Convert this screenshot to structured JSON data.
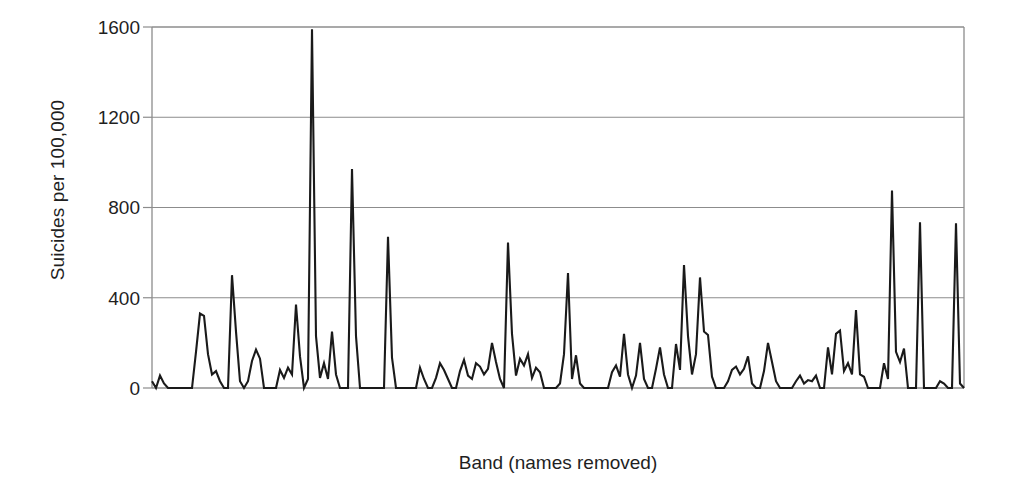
{
  "chart_data": {
    "type": "line",
    "title": "",
    "subtitle": "",
    "xlabel": "Band (names removed)",
    "ylabel": "Suicides per 100,000",
    "ylim": [
      0,
      1600
    ],
    "yticks": [
      0,
      400,
      800,
      1200,
      1600
    ],
    "ytick_labels": [
      "0",
      "400",
      "800",
      "1200",
      "1600"
    ],
    "xticks": [],
    "xtick_labels": [],
    "grid": "horizontal",
    "legend": "none",
    "legend_position": "none",
    "series_color": "#1a1a1a",
    "axis_color": "#555555",
    "grid_color": "#8c8c8c",
    "background": "#ffffff",
    "series": [
      {
        "name": "Suicides per 100,000 by band",
        "x": [
          0,
          1,
          2,
          3,
          4,
          5,
          6,
          7,
          8,
          9,
          10,
          11,
          12,
          13,
          14,
          15,
          16,
          17,
          18,
          19,
          20,
          21,
          22,
          23,
          24,
          25,
          26,
          27,
          28,
          29,
          30,
          31,
          32,
          33,
          34,
          35,
          36,
          37,
          38,
          39,
          40,
          41,
          42,
          43,
          44,
          45,
          46,
          47,
          48,
          49,
          50,
          51,
          52,
          53,
          54,
          55,
          56,
          57,
          58,
          59,
          60,
          61,
          62,
          63,
          64,
          65,
          66,
          67,
          68,
          69,
          70,
          71,
          72,
          73,
          74,
          75,
          76,
          77,
          78,
          79,
          80,
          81,
          82,
          83,
          84,
          85,
          86,
          87,
          88,
          89,
          90,
          91,
          92,
          93,
          94,
          95,
          96,
          97,
          98,
          99,
          100,
          101,
          102,
          103,
          104,
          105,
          106,
          107,
          108,
          109,
          110,
          111,
          112,
          113,
          114,
          115,
          116,
          117,
          118,
          119,
          120,
          121,
          122,
          123,
          124,
          125,
          126,
          127,
          128,
          129,
          130,
          131,
          132,
          133,
          134,
          135,
          136,
          137,
          138,
          139,
          140,
          141,
          142,
          143,
          144,
          145,
          146,
          147,
          148,
          149,
          150,
          151,
          152,
          153,
          154,
          155,
          156,
          157,
          158,
          159,
          160,
          161,
          162,
          163,
          164,
          165,
          166,
          167,
          168,
          169,
          170,
          171,
          172,
          173,
          174,
          175,
          176,
          177,
          178,
          179,
          180,
          181,
          182,
          183,
          184,
          185,
          186,
          187,
          188,
          189,
          190,
          191,
          192,
          193,
          194,
          195,
          196,
          197,
          198,
          199,
          200,
          201,
          202,
          203
        ],
        "values": [
          30,
          0,
          55,
          20,
          0,
          0,
          0,
          0,
          0,
          0,
          0,
          160,
          330,
          320,
          150,
          60,
          75,
          30,
          0,
          0,
          500,
          250,
          30,
          0,
          30,
          120,
          170,
          130,
          0,
          0,
          0,
          0,
          80,
          45,
          90,
          60,
          370,
          140,
          0,
          40,
          1590,
          230,
          45,
          110,
          40,
          250,
          60,
          0,
          0,
          0,
          970,
          230,
          0,
          0,
          0,
          0,
          0,
          0,
          0,
          670,
          135,
          0,
          0,
          0,
          0,
          0,
          0,
          90,
          40,
          0,
          0,
          45,
          110,
          80,
          40,
          0,
          0,
          75,
          125,
          55,
          40,
          110,
          95,
          60,
          85,
          200,
          115,
          40,
          0,
          645,
          240,
          55,
          130,
          100,
          150,
          45,
          90,
          70,
          0,
          0,
          0,
          0,
          20,
          150,
          510,
          40,
          145,
          20,
          0,
          0,
          0,
          0,
          0,
          0,
          0,
          70,
          100,
          50,
          240,
          60,
          0,
          55,
          200,
          40,
          0,
          0,
          85,
          180,
          60,
          0,
          0,
          195,
          80,
          545,
          230,
          60,
          150,
          490,
          250,
          235,
          50,
          0,
          0,
          0,
          30,
          80,
          95,
          60,
          85,
          140,
          20,
          0,
          0,
          75,
          200,
          115,
          30,
          0,
          0,
          0,
          0,
          30,
          55,
          20,
          35,
          30,
          55,
          0,
          0,
          180,
          60,
          240,
          255,
          75,
          110,
          60,
          345,
          60,
          50,
          0,
          0,
          0,
          0,
          110,
          40,
          875,
          160,
          115,
          175,
          0,
          0,
          0,
          735,
          0,
          0,
          0,
          0,
          30,
          20,
          0,
          0,
          730,
          20,
          0
        ]
      }
    ],
    "peaks": [
      {
        "label": "maximum",
        "value": 1590
      },
      {
        "label": "second",
        "value": 970
      },
      {
        "label": "third",
        "value": 875
      },
      {
        "label": "fourth",
        "value": 735
      },
      {
        "label": "fifth",
        "value": 730
      },
      {
        "label": "sixth",
        "value": 670
      },
      {
        "label": "seventh",
        "value": 645
      }
    ]
  },
  "axes": {
    "y_tick_labels": [
      "1600",
      "1200",
      "800",
      "400",
      "0"
    ],
    "y_axis_title": "Suicides per 100,000",
    "x_axis_title": "Band (names removed)"
  }
}
